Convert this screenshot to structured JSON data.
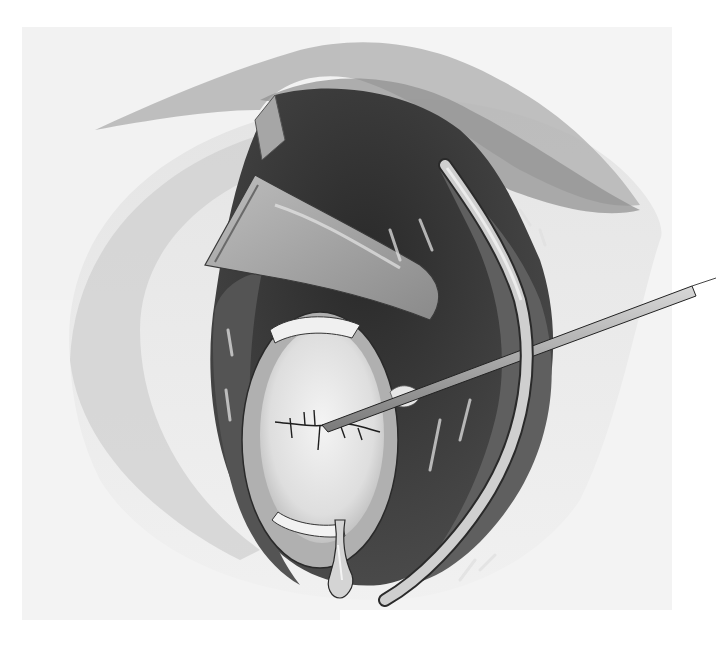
{
  "illustration": {
    "kind": "surgical-illustration",
    "style": "grayscale watercolor",
    "canvas": {
      "width": 722,
      "height": 652
    },
    "colors": {
      "background": "#ffffff",
      "paper": "#f3f3f3",
      "skin_light": "#d9d9d9",
      "skin_mid": "#a8a8a8",
      "cavity_dark": "#3a3a3a",
      "tissue_dark": "#5e5e5e",
      "organ_light": "#ececec",
      "instrument": "#9a9a9a",
      "outline": "#1e1e1e"
    },
    "elements": [
      "incision-opening",
      "retractor-blade",
      "upper-skin-flap",
      "deep-cavity",
      "organ-with-sutured-incision",
      "suture-needle-probe",
      "curved-catheter",
      "drain-tip"
    ]
  }
}
